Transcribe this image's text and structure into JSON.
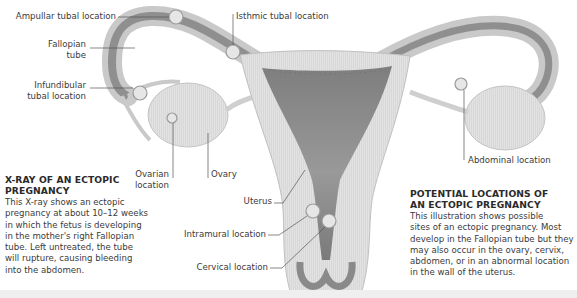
{
  "labels": {
    "ampullar": "Ampullar tubal location",
    "fallopian_line1": "Fallopian",
    "fallopian_line2": "tube",
    "infundibular_line1": "Infundibular",
    "infundibular_line2": "tubal location",
    "ovarian_line1": "Ovarian",
    "ovarian_line2": "location",
    "ovary": "Ovary",
    "isthmic": "Isthmic tubal location",
    "uterus": "Uterus",
    "intramural": "Intramural location",
    "cervical": "Cervical location",
    "abdominal": "Abdominal location"
  },
  "xray_caption": {
    "title_line1": "X-RAY OF AN ECTOPIC",
    "title_line2": "PREGNANCY",
    "body": [
      "This X-ray shows an ectopic",
      "pregnancy at about 10–12 weeks",
      "in which the fetus is developing",
      "in the mother's right Fallopian",
      "tube. Left untreated, the tube",
      "will rupture, causing bleeding",
      "into the abdomen."
    ]
  },
  "locations_caption": {
    "title_line1": "POTENTIAL LOCATIONS OF",
    "title_line2": "AN ECTOPIC PREGNANCY",
    "body": [
      "This illustration shows possible",
      "sites of an ectopic pregnancy. Most",
      "develop in the Fallopian tube but they",
      "may also occur in the ovary, cervix,",
      "abdomen, or in an abnormal location",
      "in the wall of the uterus."
    ]
  },
  "colors": {
    "tissue_light": "#dcdcdc",
    "tissue_mid": "#b5b5b5",
    "lining_dark": "#8a8a8a",
    "leader_line": "#555555"
  }
}
